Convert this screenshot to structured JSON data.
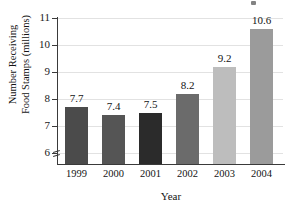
{
  "chart_data": {
    "type": "bar",
    "title": "",
    "xlabel": "Year",
    "ylabel": "Number Receiving Food Stamps (millions)",
    "ylabel_lines": [
      "Number Receiving",
      "Food Stamps (millions)"
    ],
    "categories": [
      "1999",
      "2000",
      "2001",
      "2002",
      "2003",
      "2004"
    ],
    "values": [
      7.7,
      7.4,
      7.5,
      8.2,
      9.2,
      10.6
    ],
    "value_labels": [
      "7.7",
      "7.4",
      "7.5",
      "8.2",
      "9.2",
      "10.6"
    ],
    "ylim": [
      5.6,
      11
    ],
    "yticks": [
      6,
      7,
      8,
      9,
      10,
      11
    ],
    "ytick_labels": [
      "6",
      "7",
      "8",
      "9",
      "10",
      "11"
    ],
    "grid": "horizontal",
    "legend": "none",
    "axis_break": true,
    "bar_colors": [
      "#4b4b4b",
      "#555555",
      "#2b2b2b",
      "#6b6b6b",
      "#bdbdbd",
      "#9b9b9b"
    ],
    "gridline_color": "#e2e2e2",
    "axis_color": "#3a3a3a"
  }
}
